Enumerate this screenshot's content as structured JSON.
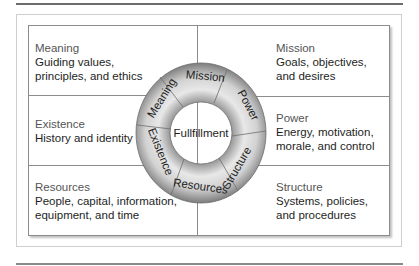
{
  "diagram": {
    "center_label": "Fullfillment",
    "ring_segments": [
      "Mission",
      "Power",
      "Structure",
      "Resources",
      "Existence",
      "Meaning"
    ],
    "cells": {
      "meaning": {
        "title": "Meaning",
        "desc": "Guiding values,\nprinciples, and ethics"
      },
      "existence": {
        "title": "Existence",
        "desc": "History and identity"
      },
      "resources": {
        "title": "Resources",
        "desc": "People, capital, information,\nequipment, and time"
      },
      "mission": {
        "title": "Mission",
        "desc": "Goals, objectives,\nand desires"
      },
      "power": {
        "title": "Power",
        "desc": "Energy, motivation,\nmorale, and control"
      },
      "structure": {
        "title": "Structure",
        "desc": "Systems, policies,\nand procedures"
      }
    },
    "colors": {
      "ring_light": "#e6e6e6",
      "ring_dark": "#8a8a8a",
      "border": "#8c8c8c"
    }
  }
}
